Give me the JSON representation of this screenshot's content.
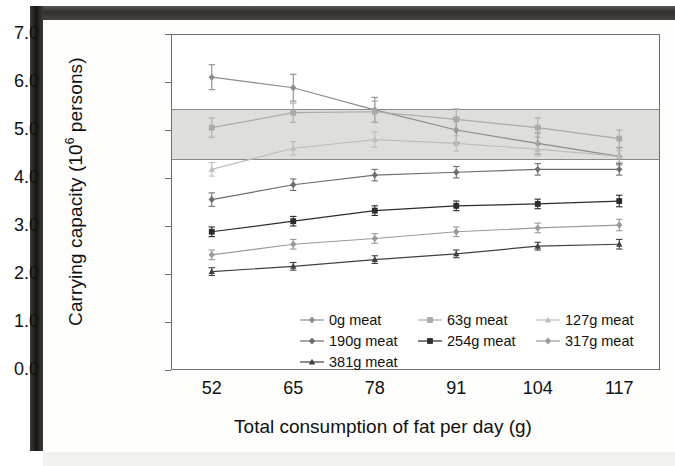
{
  "figure": {
    "ylabel_main": "Carrying capacity (10",
    "ylabel_exp": "6",
    "ylabel_tail": " persons)",
    "xlabel": "Total consumption of fat per day (g)"
  },
  "axes": {
    "y_ticks": [
      "0.0",
      "1.0",
      "2.0",
      "3.0",
      "4.0",
      "5.0",
      "6.0",
      "7.0"
    ],
    "x_ticks": [
      "52",
      "65",
      "78",
      "91",
      "104",
      "117"
    ]
  },
  "legend": [
    {
      "label": "0g meat"
    },
    {
      "label": "63g meat"
    },
    {
      "label": "127g meat"
    },
    {
      "label": "190g meat"
    },
    {
      "label": "254g meat"
    },
    {
      "label": "317g meat"
    },
    {
      "label": "381g meat"
    }
  ],
  "chart_data": {
    "type": "line",
    "title": "",
    "xlabel": "Total consumption of fat per day (g)",
    "ylabel": "Carrying capacity (10^6 persons)",
    "x": [
      52,
      65,
      78,
      91,
      104,
      117
    ],
    "xlim": [
      45.5,
      123.5
    ],
    "ylim": [
      0.0,
      7.0
    ],
    "grid": false,
    "legend_position": "inside-bottom-center",
    "error_bars": true,
    "reference_band": {
      "label": "",
      "ymin": 4.4,
      "ymax": 5.45,
      "color": "#dededa"
    },
    "series": [
      {
        "name": "0g meat",
        "color": "#8c8c8c",
        "marker": "diamond",
        "values": [
          6.1,
          5.88,
          5.42,
          5.0,
          4.72,
          4.45
        ],
        "errors": [
          0.26,
          0.28,
          0.26,
          0.26,
          0.22,
          0.18
        ]
      },
      {
        "name": "63g meat",
        "color": "#aaaaaa",
        "marker": "square",
        "values": [
          5.05,
          5.36,
          5.38,
          5.22,
          5.05,
          4.82
        ],
        "errors": [
          0.2,
          0.2,
          0.22,
          0.22,
          0.2,
          0.18
        ]
      },
      {
        "name": "127g meat",
        "color": "#bdbdbd",
        "marker": "triangle",
        "values": [
          4.18,
          4.62,
          4.8,
          4.72,
          4.6,
          4.45
        ],
        "errors": [
          0.14,
          0.14,
          0.16,
          0.16,
          0.14,
          0.12
        ]
      },
      {
        "name": "190g meat",
        "color": "#6e6e6e",
        "marker": "diamond",
        "values": [
          3.55,
          3.86,
          4.06,
          4.12,
          4.18,
          4.18
        ],
        "errors": [
          0.14,
          0.12,
          0.12,
          0.12,
          0.12,
          0.12
        ]
      },
      {
        "name": "254g meat",
        "color": "#2b2b2b",
        "marker": "square",
        "values": [
          2.88,
          3.1,
          3.32,
          3.42,
          3.46,
          3.52
        ],
        "errors": [
          0.1,
          0.1,
          0.1,
          0.1,
          0.1,
          0.12
        ]
      },
      {
        "name": "317g meat",
        "color": "#9a9a9a",
        "marker": "diamond",
        "values": [
          2.4,
          2.62,
          2.74,
          2.88,
          2.96,
          3.02
        ],
        "errors": [
          0.1,
          0.1,
          0.1,
          0.1,
          0.1,
          0.12
        ]
      },
      {
        "name": "381g meat",
        "color": "#404040",
        "marker": "triangle",
        "values": [
          2.05,
          2.16,
          2.3,
          2.42,
          2.58,
          2.62
        ],
        "errors": [
          0.08,
          0.08,
          0.08,
          0.08,
          0.08,
          0.1
        ]
      }
    ]
  }
}
